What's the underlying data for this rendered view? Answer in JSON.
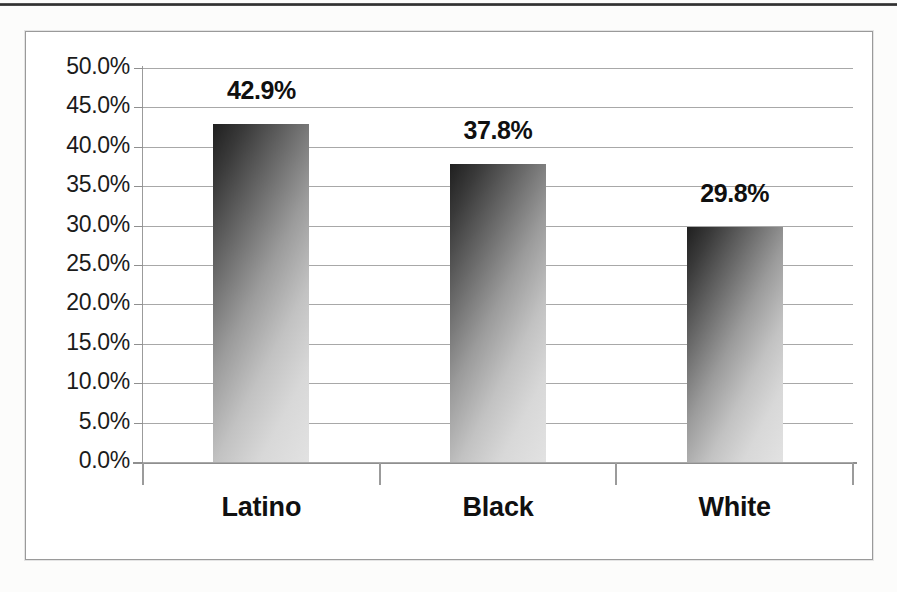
{
  "chart_data": {
    "type": "bar",
    "title": "",
    "subtitle": "",
    "xlabel": "",
    "ylabel": "",
    "categories": [
      "Latino",
      "Black",
      "White"
    ],
    "values": [
      42.9,
      37.8,
      29.8
    ],
    "value_labels": [
      "42.9%",
      "37.8%",
      "29.8%"
    ],
    "ylim": [
      0,
      50
    ],
    "ytick_step": 5,
    "ytick_labels": [
      "50.0%",
      "45.0%",
      "40.0%",
      "35.0%",
      "30.0%",
      "25.0%",
      "20.0%",
      "15.0%",
      "10.0%",
      "5.0%",
      "0.0%"
    ],
    "ytick_values": [
      50,
      45,
      40,
      35,
      30,
      25,
      20,
      15,
      10,
      5,
      0
    ],
    "grid": true,
    "grid_axis": "y",
    "legend": false,
    "legend_position": "none",
    "series": [
      {
        "name": "",
        "values": [
          42.9,
          37.8,
          29.8
        ]
      }
    ],
    "colors": {
      "bar_dark": "#1f1f1f",
      "bar_light": "#e2e2e2",
      "gridline": "#a8a8a8",
      "axis": "#8f8f8f",
      "text": "#101010",
      "frame": "#9a9a9a",
      "background": "#ffffff"
    }
  },
  "axis": {
    "ticks": [
      {
        "label": "50.0%",
        "value": 50
      },
      {
        "label": "45.0%",
        "value": 45
      },
      {
        "label": "40.0%",
        "value": 40
      },
      {
        "label": "35.0%",
        "value": 35
      },
      {
        "label": "30.0%",
        "value": 30
      },
      {
        "label": "25.0%",
        "value": 25
      },
      {
        "label": "20.0%",
        "value": 20
      },
      {
        "label": "15.0%",
        "value": 15
      },
      {
        "label": "10.0%",
        "value": 10
      },
      {
        "label": "5.0%",
        "value": 5
      },
      {
        "label": "0.0%",
        "value": 0
      }
    ]
  },
  "bars": [
    {
      "category": "Latino",
      "value": 42.9,
      "label": "42.9%"
    },
    {
      "category": "Black",
      "value": 37.8,
      "label": "37.8%"
    },
    {
      "category": "White",
      "value": 29.8,
      "label": "29.8%"
    }
  ]
}
